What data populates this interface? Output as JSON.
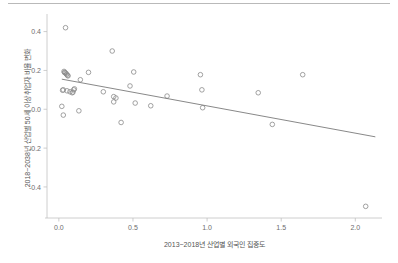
{
  "figure": {
    "background_color": "#ffffff",
    "top_rule_color": "#b9b9b9",
    "marker_color": "#8a8a8a",
    "line_color": "#7a7a7a",
    "axis_color": "#c2c2c2",
    "text_color": "#6d6d6d"
  },
  "chart_data": {
    "type": "scatter",
    "title": "",
    "subtitle": "",
    "xlabel": "2013~2018년 산업별 외국인 집중도",
    "ylabel": "2018~2038년 산업별 50세 이상 취업자 비율 변화",
    "xlim": [
      -0.08,
      2.18
    ],
    "ylim": [
      -0.56,
      0.47
    ],
    "xticks": [
      0.0,
      0.5,
      1.0,
      1.5,
      2.0
    ],
    "xticklabels": [
      "0.0",
      "0.5",
      "1.0",
      "1.5",
      "2.0"
    ],
    "yticks": [
      0.4,
      0.2,
      0.0,
      -0.2,
      -0.4
    ],
    "yticklabels": [
      "0.4",
      "0.2",
      "0.0",
      "-0.2",
      "-0.4"
    ],
    "grid": false,
    "legend": null,
    "legend_position": "none",
    "marker_shape": "open-circle",
    "x": [
      0.045,
      0.035,
      0.038,
      0.042,
      0.048,
      0.052,
      0.058,
      0.062,
      0.03,
      0.025,
      0.055,
      0.075,
      0.09,
      0.095,
      0.1,
      0.105,
      0.02,
      0.03,
      0.135,
      0.145,
      0.2,
      0.3,
      0.36,
      0.37,
      0.37,
      0.385,
      0.42,
      0.48,
      0.505,
      0.515,
      0.62,
      0.73,
      0.955,
      0.965,
      0.97,
      1.345,
      1.44,
      1.645,
      2.07
    ],
    "y": [
      0.42,
      0.195,
      0.19,
      0.188,
      0.185,
      0.18,
      0.175,
      0.172,
      0.1,
      0.098,
      0.095,
      0.09,
      0.085,
      0.088,
      0.1,
      0.105,
      0.015,
      -0.03,
      -0.008,
      0.152,
      0.19,
      0.09,
      0.3,
      0.065,
      0.038,
      0.058,
      -0.068,
      0.12,
      0.192,
      0.032,
      0.018,
      0.068,
      0.178,
      0.1,
      0.008,
      0.085,
      -0.078,
      0.178,
      -0.5
    ],
    "trendline": {
      "type": "linear-fit",
      "x_start": 0.02,
      "y_start": 0.155,
      "x_end": 2.135,
      "y_end": -0.142
    }
  }
}
